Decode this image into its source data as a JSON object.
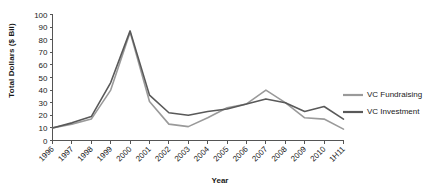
{
  "chart_data": {
    "type": "line",
    "title": "",
    "xlabel": "Year",
    "ylabel": "Total Dollars ($ Bil)",
    "ylim": [
      0,
      100
    ],
    "ytick_step": 10,
    "yticks": [
      0,
      10,
      20,
      30,
      40,
      50,
      60,
      70,
      80,
      90,
      100
    ],
    "grid": false,
    "legend_position": "right",
    "categories": [
      "1996",
      "1997",
      "1998",
      "1999",
      "2000",
      "2001",
      "2002",
      "2003",
      "2004",
      "2005",
      "2006",
      "2007",
      "2008",
      "2009",
      "2010",
      "1H11"
    ],
    "series": [
      {
        "name": "VC Fundraising",
        "color": "#9a9a9a",
        "values": [
          10,
          13,
          17,
          40,
          86,
          31,
          13,
          11,
          18,
          26,
          29,
          40,
          30,
          18,
          17,
          9
        ]
      },
      {
        "name": "VC Investment",
        "color": "#595959",
        "values": [
          10,
          14,
          19,
          46,
          87,
          36,
          22,
          20,
          23,
          25,
          29,
          33,
          30,
          23,
          27,
          17
        ]
      }
    ]
  },
  "legend": {
    "items": [
      {
        "label": "VC Fundraising",
        "color": "#9a9a9a"
      },
      {
        "label": "VC Investment",
        "color": "#595959"
      }
    ]
  },
  "axes": {
    "y_title": "Total Dollars ($ Bil)",
    "x_title": "Year"
  }
}
